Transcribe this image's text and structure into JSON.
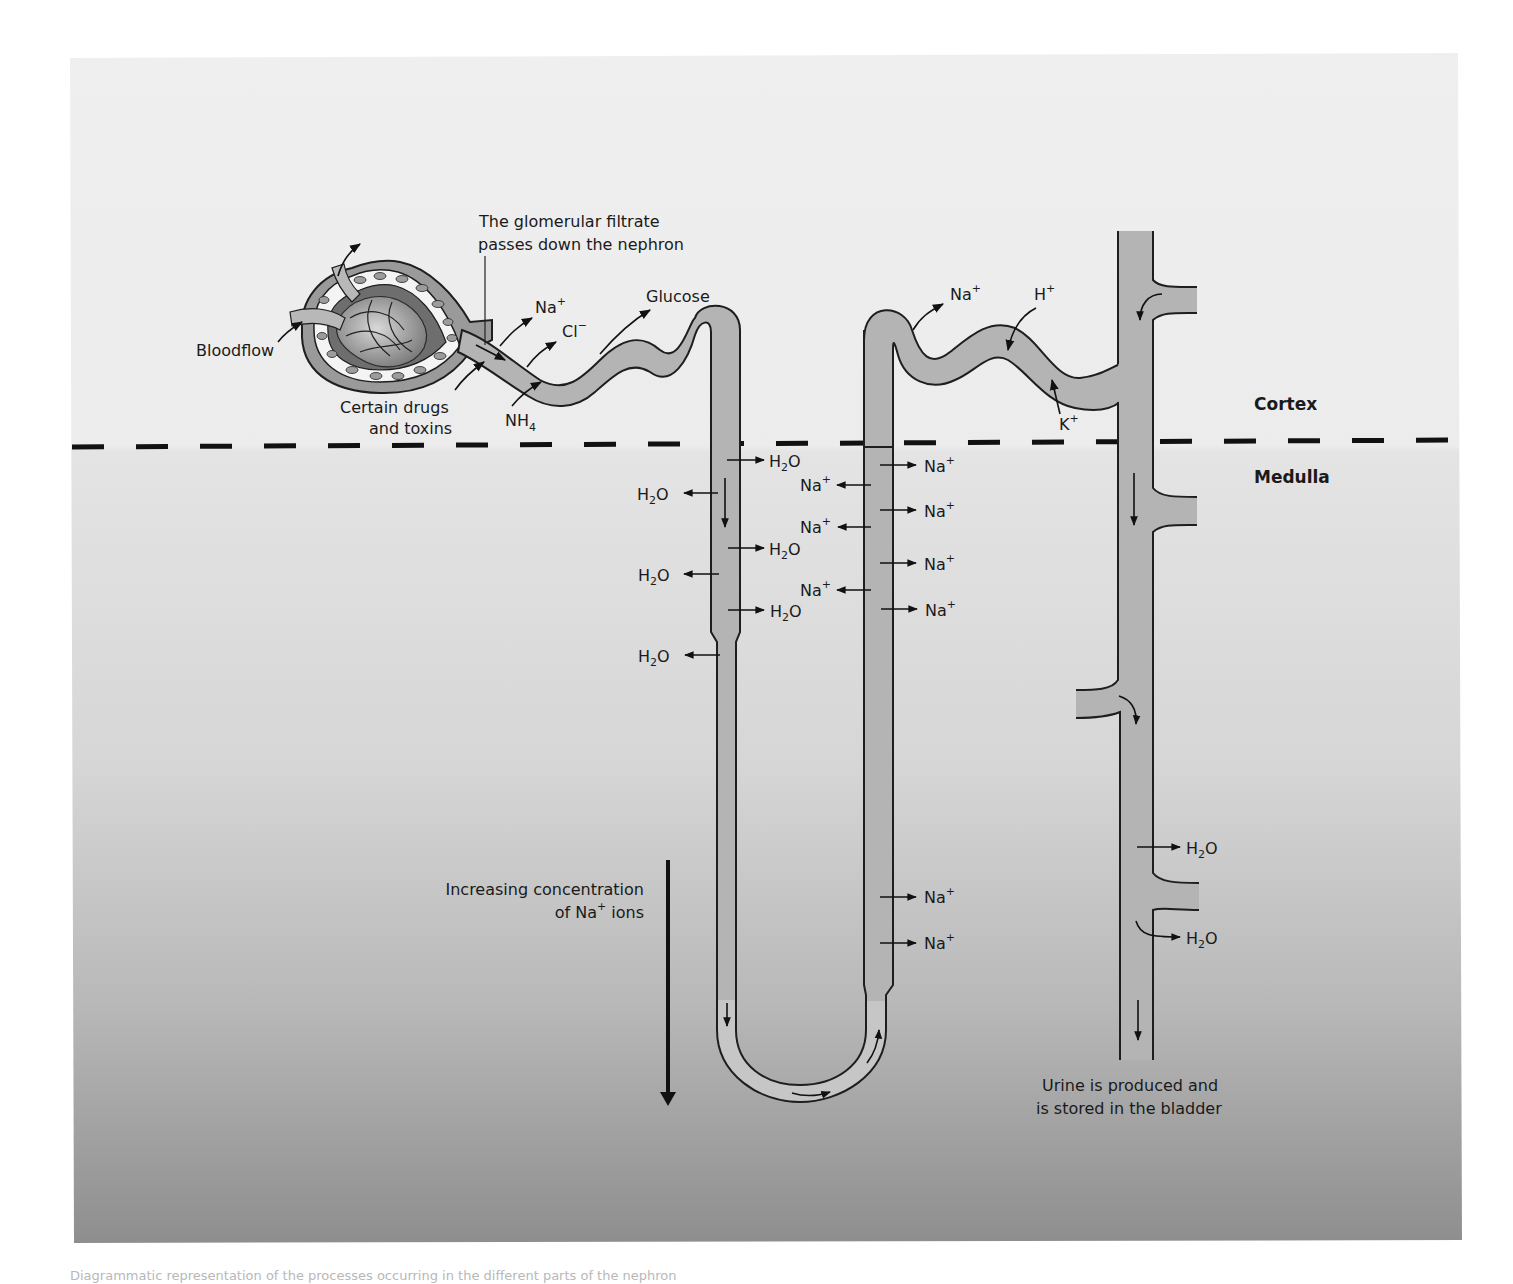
{
  "figure": {
    "regions": {
      "cortex": "Cortex",
      "medulla": "Medulla"
    },
    "labels": {
      "bloodflow": "Bloodflow",
      "drugs_line1": "Certain drugs",
      "drugs_line2": "and toxins",
      "filtrate_line1": "The glomerular filtrate",
      "filtrate_line2": "passes down the nephron",
      "glucose": "Glucose",
      "na": "Na",
      "cl": "Cl",
      "nh4": "NH",
      "nh4_sub": "4",
      "h": "H",
      "k": "K",
      "plus": "+",
      "minus": "−",
      "h2o_h": "H",
      "h2o_2": "2",
      "h2o_o": "O",
      "gradient_line1": "Increasing concentration",
      "gradient_line2_a": "of Na",
      "gradient_line2_b": " ions",
      "urine_line1": "Urine is produced and",
      "urine_line2": "is stored in the bladder"
    },
    "colors": {
      "panel_top": "#efefef",
      "panel_bottom": "#8e8e8e",
      "tube_fill": "#b4b4b4",
      "outline": "#1e1e1e"
    }
  },
  "caption": "Diagrammatic representation of the processes occurring in the different parts of the nephron"
}
